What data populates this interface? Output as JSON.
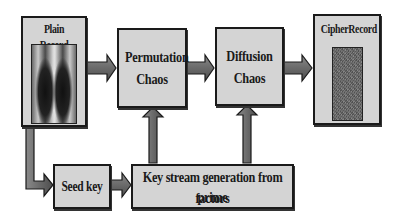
{
  "diagram": {
    "nodes": {
      "plain_record": {
        "label": "Plain Record",
        "image": "chest-xray"
      },
      "permutation": {
        "label_line1": "Permutation",
        "label_line2": "Chaos"
      },
      "diffusion": {
        "label_line1": "Diffusion",
        "label_line2": "Chaos"
      },
      "cipher_record": {
        "label": "CipherRecord",
        "image": "encrypted-noise"
      },
      "seed_key": {
        "label": "Seed key"
      },
      "key_stream": {
        "label_line1": "Key stream generation from prime",
        "label_line2": "factors"
      }
    },
    "edges": [
      {
        "from": "Plain Record",
        "to": "Permutation Chaos"
      },
      {
        "from": "Permutation Chaos",
        "to": "Diffusion Chaos"
      },
      {
        "from": "Diffusion Chaos",
        "to": "CipherRecord"
      },
      {
        "from": "Plain Record",
        "to": "Seed key"
      },
      {
        "from": "Seed key",
        "to": "Key stream generation from prime factors"
      },
      {
        "from": "Key stream generation from prime factors",
        "to": "Permutation Chaos"
      },
      {
        "from": "Key stream generation from prime factors",
        "to": "Diffusion Chaos"
      }
    ],
    "colors": {
      "box_fill": "#d4d4d4",
      "border": "#1a1a1a",
      "arrow_fill": "#6e6e6e"
    }
  }
}
